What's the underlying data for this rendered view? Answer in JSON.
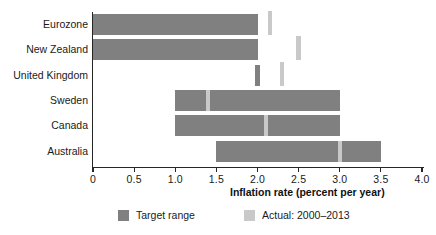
{
  "chart_data": {
    "type": "bar",
    "orientation": "horizontal",
    "title": "",
    "subtitle": "",
    "xlabel": "Inflation rate (percent per year)",
    "ylabel": "",
    "xlim": [
      0,
      4.0
    ],
    "xticks": [
      0,
      0.5,
      1.0,
      1.5,
      2.0,
      2.5,
      3.0,
      3.5,
      4.0
    ],
    "xtick_labels": [
      "0",
      "0.5",
      "1.0",
      "1.5",
      "2.0",
      "2.5",
      "3.0",
      "3.5",
      "4.0"
    ],
    "grid": false,
    "legend_position": "bottom",
    "categories": [
      "Eurozone",
      "New Zealand",
      "United Kingdom",
      "Sweden",
      "Canada",
      "Australia"
    ],
    "series": [
      {
        "name": "Target range",
        "color": "#808080",
        "type": "range",
        "values": [
          {
            "category": "Eurozone",
            "low": 0.0,
            "high": 2.0
          },
          {
            "category": "New Zealand",
            "low": 0.0,
            "high": 2.0
          },
          {
            "category": "United Kingdom",
            "low": 2.0,
            "high": 2.0
          },
          {
            "category": "Sweden",
            "low": 1.0,
            "high": 3.0
          },
          {
            "category": "Canada",
            "low": 1.0,
            "high": 3.0
          },
          {
            "category": "Australia",
            "low": 1.5,
            "high": 3.5
          }
        ]
      },
      {
        "name": "Actual: 2000–2013",
        "color": "#c9c9c9",
        "type": "marker",
        "values": [
          {
            "category": "Eurozone",
            "value": 2.15
          },
          {
            "category": "New Zealand",
            "value": 2.5
          },
          {
            "category": "United Kingdom",
            "value": 2.3
          },
          {
            "category": "Sweden",
            "value": 1.4
          },
          {
            "category": "Canada",
            "value": 2.1
          },
          {
            "category": "Australia",
            "value": 3.0
          }
        ]
      }
    ],
    "annotations": []
  },
  "legend": {
    "items": [
      {
        "label": "Target range",
        "color": "#808080"
      },
      {
        "label": "Actual: 2000–2013",
        "color": "#c9c9c9"
      }
    ]
  },
  "axis": {
    "x_title": "Inflation rate (percent per year)"
  }
}
